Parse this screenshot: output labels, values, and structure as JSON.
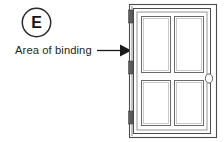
{
  "figure": {
    "panel_label": "E",
    "annotation_label": "Area of binding",
    "arrow_target": "door hinge edge",
    "colors": {
      "background": "#ffffff",
      "line": "#4d4d4d",
      "line_dark": "#2b2b2b",
      "text": "#231f20",
      "hinge_fill": "#5c5c5c",
      "arrow_fill": "#1a1a1a"
    },
    "parts": {
      "outer_frame": "door-frame-casing",
      "door_slab": "door-slab",
      "panels": [
        "upper-left-panel",
        "upper-right-panel",
        "lower-left-panel",
        "lower-right-panel"
      ],
      "hinges": [
        "top-hinge",
        "middle-hinge",
        "bottom-hinge"
      ],
      "knob": "door-knob"
    }
  }
}
